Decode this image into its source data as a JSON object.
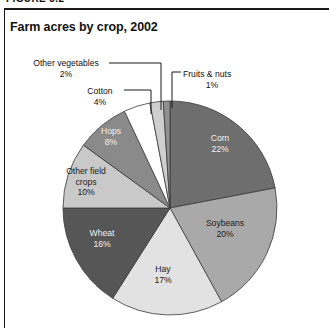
{
  "figure": {
    "caption_partial": "FIGURE 3.2",
    "title": "Farm acres by crop, 2002"
  },
  "chart_data": {
    "type": "pie",
    "title": "Farm acres by crop, 2002",
    "xlabel": "",
    "ylabel": "",
    "units": "percent of farm acres",
    "legend_position": "none",
    "grid": false,
    "start_angle_deg": 0,
    "direction": "clockwise",
    "categories": [
      "Corn",
      "Soybeans",
      "Hay",
      "Wheat",
      "Other field crops",
      "Hops",
      "Cotton",
      "Other vegetables",
      "Fruits & nuts"
    ],
    "values": [
      22,
      20,
      17,
      16,
      10,
      8,
      4,
      2,
      1
    ],
    "value_labels": [
      "22%",
      "20%",
      "17%",
      "16%",
      "10%",
      "8%",
      "4%",
      "2%",
      "1%"
    ],
    "colors": [
      "#6e6e6e",
      "#a9a9a9",
      "#e2e2e2",
      "#565656",
      "#c9c9c9",
      "#8a8a8a",
      "#ffffff",
      "#cfcfcf",
      "#909090"
    ],
    "label_placement": [
      "inside",
      "inside",
      "inside",
      "inside",
      "inside",
      "inside",
      "callout",
      "callout",
      "callout"
    ],
    "slices": [
      {
        "name": "Corn",
        "value": 22,
        "label": "22%",
        "color": "#6e6e6e",
        "text_color": "light"
      },
      {
        "name": "Soybeans",
        "value": 20,
        "label": "20%",
        "color": "#a9a9a9",
        "text_color": "dark"
      },
      {
        "name": "Hay",
        "value": 17,
        "label": "17%",
        "color": "#e2e2e2",
        "text_color": "dark"
      },
      {
        "name": "Wheat",
        "value": 16,
        "label": "16%",
        "color": "#565656",
        "text_color": "light"
      },
      {
        "name": "Other field crops",
        "value": 10,
        "label": "10%",
        "color": "#c9c9c9",
        "text_color": "dark"
      },
      {
        "name": "Hops",
        "value": 8,
        "label": "8%",
        "color": "#8a8a8a",
        "text_color": "light"
      },
      {
        "name": "Cotton",
        "value": 4,
        "label": "4%",
        "color": "#ffffff",
        "text_color": "dark"
      },
      {
        "name": "Other vegetables",
        "value": 2,
        "label": "2%",
        "color": "#cfcfcf",
        "text_color": "dark"
      },
      {
        "name": "Fruits & nuts",
        "value": 1,
        "label": "1%",
        "color": "#909090",
        "text_color": "dark"
      }
    ]
  },
  "labels": {
    "corn_name": "Corn",
    "corn_pct": "22%",
    "soybeans_name": "Soybeans",
    "soybeans_pct": "20%",
    "hay_name": "Hay",
    "hay_pct": "17%",
    "wheat_name": "Wheat",
    "wheat_pct": "16%",
    "other_field_crops_name": "Other field",
    "other_field_crops_name2": "crops",
    "other_field_crops_pct": "10%",
    "hops_name": "Hops",
    "hops_pct": "8%",
    "cotton_name": "Cotton",
    "cotton_pct": "4%",
    "other_vegetables_name": "Other vegetables",
    "other_vegetables_pct": "2%",
    "fruits_nuts_name": "Fruits & nuts",
    "fruits_nuts_pct": "1%"
  }
}
